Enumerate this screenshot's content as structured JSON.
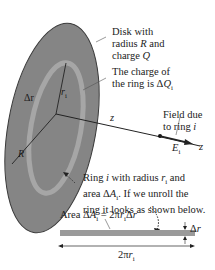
{
  "diagram": {
    "colors": {
      "disk_fill": "#858585",
      "disk_edge": "#3a3a3a",
      "ring_fill": "#a8a8a8",
      "strip_fill": "#9a9a9a",
      "line": "#222222",
      "text": "#222222"
    },
    "labels": {
      "disk": [
        "Disk with",
        "radius R and",
        "charge Q"
      ],
      "ring_charge": [
        "The charge of",
        "the ring is ΔQ",
        "i"
      ],
      "field": [
        "Field due",
        "to ring i"
      ],
      "ring_desc": [
        "Ring i with radius r",
        "i",
        " and",
        "area ΔA",
        "i",
        ". If we unroll the",
        "ring it looks as shown below."
      ],
      "area": "Area ΔA",
      "area_sub": "i",
      "area_eq": " = 2πr",
      "area_eq_sub": "i",
      "area_eq_end": "Δr",
      "delta_r": "Δr",
      "length": "2πr",
      "length_sub": "i",
      "z_axis_1": "z",
      "z_axis_2": "z",
      "E_vector": "E",
      "E_sub": "i",
      "R": "R",
      "r_i": "r",
      "r_i_sub": "i",
      "delta_r_disk": "Δr"
    }
  }
}
